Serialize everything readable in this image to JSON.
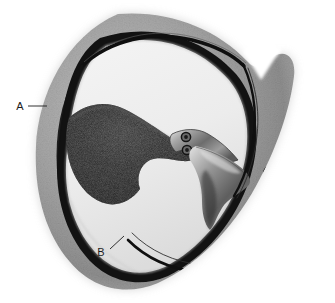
{
  "figure": {
    "kind": "medical-illustration",
    "width": 335,
    "height": 303,
    "background_color": "#ffffff"
  },
  "labels": [
    {
      "id": "A",
      "text": "A",
      "text_x": 20,
      "text_y": 110,
      "leader": "M 28 106 L 47 106"
    },
    {
      "id": "B",
      "text": "B",
      "text_x": 101,
      "text_y": 256,
      "leader": "M 110 249 L 124 236"
    }
  ],
  "caption": {
    "text": "",
    "visible": false
  },
  "colors": {
    "outer_wall_light": "#b4b4b4",
    "outer_wall_mid": "#9a9a9a",
    "outer_wall_dark": "#7d7d7d",
    "membrane_dark": "#141414",
    "cavity_light": "#ededed",
    "cavity_shadow": "#d2d2d2",
    "placenta_dark": "#151515",
    "placenta_mid": "#3a3a3a",
    "cord_light": "#c9c9c9",
    "cord_mid": "#8b8b8b",
    "cord_dark": "#4a4a4a",
    "label_ink": "#1c1c1c",
    "page_background": "#ffffff"
  },
  "structures": [
    {
      "name": "uterine-wall-myometrium",
      "label_ref": "A",
      "tone": "speckled mid gray"
    },
    {
      "name": "decidua-membrane-line",
      "tone": "near black thin band"
    },
    {
      "name": "amniotic-cavity",
      "tone": "very light gray"
    },
    {
      "name": "placenta-mass",
      "tone": "near black textured"
    },
    {
      "name": "umbilical-cord",
      "tone": "graded gray, two vessel rings"
    },
    {
      "name": "cord-vessel-ring-upper",
      "tone": "small dark circle"
    },
    {
      "name": "cord-vessel-ring-lower",
      "tone": "small dark circle"
    },
    {
      "name": "membrane-hook-right",
      "tone": "black curved hook"
    },
    {
      "name": "membrane-hook-bottom",
      "tone": "black curved hook"
    },
    {
      "name": "wall-notch-upper-right",
      "label_ref": null,
      "tone": "V shaped indentation"
    },
    {
      "name": "lower-wall-edge",
      "label_ref": "B",
      "tone": "speckled gray rim"
    }
  ]
}
